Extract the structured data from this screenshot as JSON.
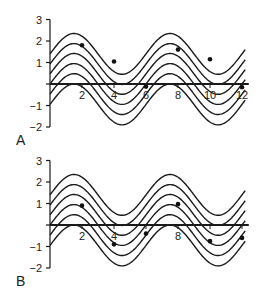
{
  "chart_data": [
    {
      "type": "line",
      "panel_label": "A",
      "title": "",
      "xlabel": "",
      "ylabel": "",
      "xlim": [
        0,
        12.3
      ],
      "ylim": [
        -2,
        3
      ],
      "x_ticks": [
        2,
        4,
        6,
        8,
        10,
        12
      ],
      "x_tick_labels": [
        "2",
        "4",
        "6",
        "8",
        "10",
        "12"
      ],
      "y_ticks": [
        3,
        2,
        1,
        0,
        -1,
        -2
      ],
      "y_tick_labels": [
        "3",
        "2",
        "1",
        "",
        "−1",
        "−2"
      ],
      "grid": false,
      "curves": {
        "formula": "y = c + A*sin(pi*x/3)",
        "amplitude": 0.95,
        "period": 6,
        "x_range": [
          0,
          12.2
        ],
        "offsets": [
          1.4,
          0.93,
          0.47,
          0,
          -0.47,
          -0.95
        ]
      },
      "series": [
        {
          "name": "observed points",
          "x": [
            2,
            4,
            6,
            8,
            10,
            12
          ],
          "y": [
            1.8,
            1.05,
            -0.12,
            1.6,
            1.15,
            -0.15
          ]
        }
      ],
      "origin_px": [
        50,
        84
      ],
      "scale_px": [
        16,
        21.5
      ]
    },
    {
      "type": "line",
      "panel_label": "B",
      "title": "",
      "xlabel": "",
      "ylabel": "",
      "xlim": [
        0,
        12.3
      ],
      "ylim": [
        -2,
        3
      ],
      "x_ticks": [
        2,
        4,
        6,
        8,
        10,
        12
      ],
      "x_tick_labels": [
        "2",
        "4",
        "",
        "8",
        "",
        ""
      ],
      "y_ticks": [
        3,
        2,
        1,
        0,
        -1,
        -2
      ],
      "y_tick_labels": [
        "3",
        "2",
        "1",
        "",
        "−1",
        "−2"
      ],
      "grid": false,
      "curves": {
        "formula": "y = c + A*sin(pi*x/3)",
        "amplitude": 0.95,
        "period": 6,
        "x_range": [
          0,
          12.2
        ],
        "offsets": [
          1.4,
          0.93,
          0.47,
          0,
          -0.47,
          -0.95
        ]
      },
      "series": [
        {
          "name": "observed points",
          "x": [
            2,
            4,
            6,
            8,
            10,
            12
          ],
          "y": [
            0.9,
            -0.9,
            -0.4,
            0.97,
            -0.75,
            -0.6
          ]
        }
      ],
      "origin_px": [
        50,
        225
      ],
      "scale_px": [
        16,
        21.5
      ]
    }
  ],
  "style": {
    "line_color": "#1a1a1a",
    "axis_color": "#1a1a1a",
    "dot_color": "#111111",
    "background": "#ffffff"
  }
}
